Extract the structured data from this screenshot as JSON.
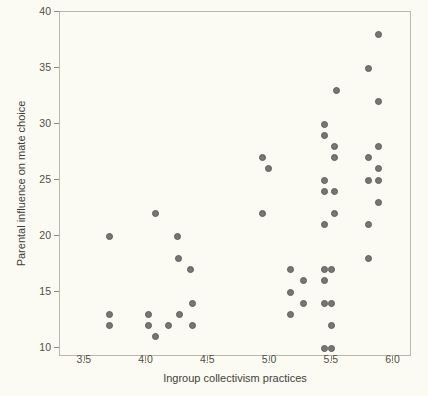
{
  "chart_data": {
    "type": "scatter",
    "title": "",
    "xlabel": "Ingroup collectivism practices",
    "ylabel": "Parental influence on mate choice",
    "xlim": [
      3.3,
      6.15
    ],
    "ylim": [
      9.2,
      40
    ],
    "grid": false,
    "legend": null,
    "xticks": [
      "3.5",
      "4.0",
      "4.5",
      "5.0",
      "5.5",
      "6.0"
    ],
    "xtick_values": [
      3.5,
      4.0,
      4.5,
      5.0,
      5.5,
      6.0
    ],
    "yticks": [
      "10",
      "15",
      "20",
      "25",
      "30",
      "35",
      "40"
    ],
    "ytick_values": [
      10,
      15,
      20,
      25,
      30,
      35,
      40
    ],
    "marker": {
      "shape": "circle",
      "fill": "#767672",
      "edge": "#5e5e5b",
      "size_px": 7
    },
    "background": "#fbfbf4",
    "frame_color": "#b9b8a8",
    "points": [
      {
        "x": 3.7,
        "y": 20
      },
      {
        "x": 3.7,
        "y": 13
      },
      {
        "x": 3.7,
        "y": 12
      },
      {
        "x": 4.02,
        "y": 13
      },
      {
        "x": 4.02,
        "y": 12
      },
      {
        "x": 4.07,
        "y": 22
      },
      {
        "x": 4.07,
        "y": 11
      },
      {
        "x": 4.18,
        "y": 12
      },
      {
        "x": 4.25,
        "y": 20
      },
      {
        "x": 4.26,
        "y": 18
      },
      {
        "x": 4.27,
        "y": 13
      },
      {
        "x": 4.36,
        "y": 17
      },
      {
        "x": 4.37,
        "y": 14
      },
      {
        "x": 4.37,
        "y": 12
      },
      {
        "x": 4.94,
        "y": 27
      },
      {
        "x": 4.94,
        "y": 22
      },
      {
        "x": 4.99,
        "y": 26
      },
      {
        "x": 5.17,
        "y": 17
      },
      {
        "x": 5.17,
        "y": 15
      },
      {
        "x": 5.17,
        "y": 13
      },
      {
        "x": 5.27,
        "y": 16
      },
      {
        "x": 5.27,
        "y": 14
      },
      {
        "x": 5.44,
        "y": 30
      },
      {
        "x": 5.44,
        "y": 29
      },
      {
        "x": 5.44,
        "y": 25
      },
      {
        "x": 5.44,
        "y": 24
      },
      {
        "x": 5.44,
        "y": 21
      },
      {
        "x": 5.44,
        "y": 17
      },
      {
        "x": 5.44,
        "y": 16
      },
      {
        "x": 5.44,
        "y": 14
      },
      {
        "x": 5.44,
        "y": 10
      },
      {
        "x": 5.5,
        "y": 17
      },
      {
        "x": 5.5,
        "y": 14
      },
      {
        "x": 5.5,
        "y": 12
      },
      {
        "x": 5.5,
        "y": 10
      },
      {
        "x": 5.52,
        "y": 28
      },
      {
        "x": 5.52,
        "y": 27
      },
      {
        "x": 5.52,
        "y": 24
      },
      {
        "x": 5.52,
        "y": 22
      },
      {
        "x": 5.54,
        "y": 33
      },
      {
        "x": 5.8,
        "y": 35
      },
      {
        "x": 5.8,
        "y": 27
      },
      {
        "x": 5.8,
        "y": 25
      },
      {
        "x": 5.8,
        "y": 21
      },
      {
        "x": 5.8,
        "y": 18
      },
      {
        "x": 5.88,
        "y": 38
      },
      {
        "x": 5.88,
        "y": 32
      },
      {
        "x": 5.88,
        "y": 28
      },
      {
        "x": 5.88,
        "y": 26
      },
      {
        "x": 5.88,
        "y": 25
      },
      {
        "x": 5.88,
        "y": 23
      }
    ]
  }
}
